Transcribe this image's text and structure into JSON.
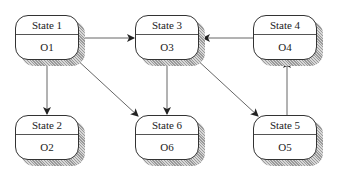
{
  "diagram": {
    "type": "state-machine",
    "nodes": [
      {
        "id": "s1",
        "state": "State 1",
        "output": "O1",
        "x": 15,
        "y": 15
      },
      {
        "id": "s2",
        "state": "State 2",
        "output": "O2",
        "x": 15,
        "y": 115
      },
      {
        "id": "s3",
        "state": "State 3",
        "output": "O3",
        "x": 135,
        "y": 15
      },
      {
        "id": "s4",
        "state": "State 4",
        "output": "O4",
        "x": 253,
        "y": 15
      },
      {
        "id": "s5",
        "state": "State 5",
        "output": "O5",
        "x": 253,
        "y": 115
      },
      {
        "id": "s6",
        "state": "State 6",
        "output": "O6",
        "x": 135,
        "y": 115
      }
    ],
    "edges": [
      {
        "from": "State 1",
        "to": "State 3"
      },
      {
        "from": "State 1",
        "to": "State 2"
      },
      {
        "from": "State 1",
        "to": "State 6"
      },
      {
        "from": "State 3",
        "to": "State 6"
      },
      {
        "from": "State 3",
        "to": "State 5"
      },
      {
        "from": "State 4",
        "to": "State 3"
      },
      {
        "from": "State 5",
        "to": "State 4"
      }
    ]
  }
}
